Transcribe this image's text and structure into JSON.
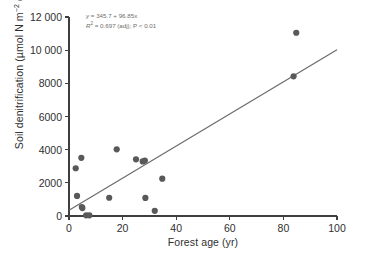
{
  "chart_data": {
    "type": "scatter",
    "title": "",
    "xlabel": "Forest age (yr)",
    "ylabel": "Soil denitrification (µmol N m−2 d−1)",
    "ylabel_parts": {
      "prefix": "Soil denitrification (µmol N m",
      "sup1": "−2",
      "mid": " d",
      "sup2": "−1",
      "suffix": ")"
    },
    "xlim": [
      0,
      100
    ],
    "ylim": [
      0,
      12000
    ],
    "xticks": [
      0,
      20,
      40,
      60,
      80,
      100
    ],
    "xticklabels": [
      "0",
      "20",
      "40",
      "60",
      "80",
      "100"
    ],
    "yticks": [
      0,
      2000,
      4000,
      6000,
      8000,
      10000,
      12000
    ],
    "yticklabels": [
      "0",
      "2000",
      "4000",
      "6000",
      "8000",
      "10 000",
      "12 000"
    ],
    "grid": false,
    "legend": null,
    "x": [
      2.5,
      3.0,
      4.6,
      4.8,
      5.0,
      6.4,
      7.6,
      15.0,
      17.8,
      25.0,
      27.5,
      28.3,
      28.5,
      32.0,
      34.8,
      83.8,
      84.8
    ],
    "y": [
      2880,
      1210,
      3510,
      540,
      480,
      40,
      40,
      1100,
      4020,
      3420,
      3290,
      3340,
      1090,
      310,
      2250,
      8420,
      11050
    ],
    "points": [
      {
        "x": 2.5,
        "y": 2880
      },
      {
        "x": 3.0,
        "y": 1210
      },
      {
        "x": 4.6,
        "y": 3510
      },
      {
        "x": 4.8,
        "y": 540
      },
      {
        "x": 5.0,
        "y": 480
      },
      {
        "x": 6.4,
        "y": 40
      },
      {
        "x": 7.6,
        "y": 40
      },
      {
        "x": 15.0,
        "y": 1100
      },
      {
        "x": 17.8,
        "y": 4020
      },
      {
        "x": 25.0,
        "y": 3420
      },
      {
        "x": 27.5,
        "y": 3290
      },
      {
        "x": 28.3,
        "y": 3340
      },
      {
        "x": 28.5,
        "y": 1090
      },
      {
        "x": 32.0,
        "y": 310
      },
      {
        "x": 34.8,
        "y": 2250
      },
      {
        "x": 83.8,
        "y": 8420
      },
      {
        "x": 84.8,
        "y": 11050
      }
    ],
    "fit": {
      "type": "linear",
      "intercept": 345.7,
      "slope": 96.85,
      "x_start": 0,
      "x_end": 100,
      "y_start": 345.7,
      "y_end": 10030.7
    },
    "annotations": {
      "equation_y": "y",
      "equation_rest": " = 345.7 + 96.85x",
      "stats_r": "R",
      "stats_sup": "2",
      "stats_rest": " = 0.697 (adj); P < 0.01"
    },
    "colors": {
      "marker": "#595959",
      "fit_line": "#6b6b6b",
      "axis": "#3f3f3f",
      "annotation_text": "#6e6e6e",
      "label_text": "#2f2f2f",
      "background": "#ffffff"
    },
    "marker_radius_px": 3.1
  }
}
